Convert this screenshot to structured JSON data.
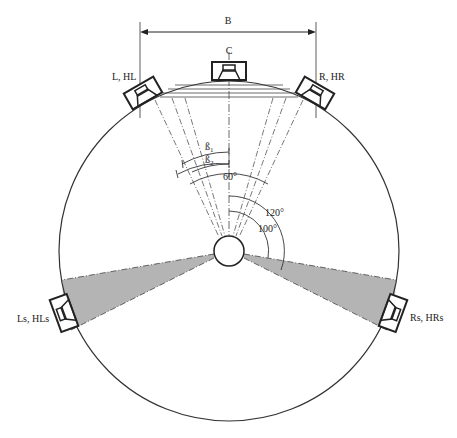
{
  "diagram": {
    "type": "surround-speaker-layout",
    "dimension_label": "B",
    "speakers": [
      {
        "id": "center",
        "label": "C",
        "angle_deg": 0
      },
      {
        "id": "left",
        "label": "L, HL",
        "angle_deg": -30
      },
      {
        "id": "right",
        "label": "R, HR",
        "angle_deg": 30
      },
      {
        "id": "left-surround",
        "label": "Ls, HLs",
        "angle_deg": -110
      },
      {
        "id": "right-surround",
        "label": "Rs, HRs",
        "angle_deg": 110
      }
    ],
    "angle_labels": {
      "beta1": "ß",
      "beta1_sub": "1",
      "beta2": "ß",
      "beta2_sub": "2",
      "front": "60°",
      "surround_outer": "120°",
      "surround_inner": "100°"
    },
    "colors": {
      "line": "#222222",
      "shade": "#b4b4b4",
      "background": "#ffffff"
    }
  }
}
